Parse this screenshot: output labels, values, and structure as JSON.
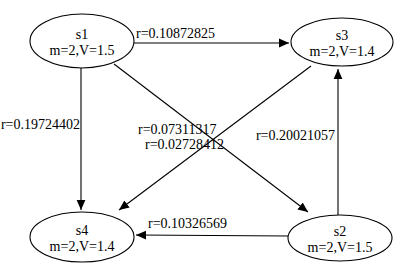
{
  "diagram": {
    "background_color": "#ffffff",
    "line_color": "#000000",
    "text_color": "#000000",
    "node_fill_color": "#ffffff",
    "nodes": [
      {
        "id": "s1",
        "label": "s1",
        "sublabel": "m=2,V=1.5",
        "cx": 82,
        "cy": 41,
        "rx": 52,
        "ry": 27
      },
      {
        "id": "s3",
        "label": "s3",
        "sublabel": "m=2,V=1.4",
        "cx": 342,
        "cy": 42,
        "rx": 51,
        "ry": 24
      },
      {
        "id": "s4",
        "label": "s4",
        "sublabel": "m=2,V=1.4",
        "cx": 82,
        "cy": 237,
        "rx": 52,
        "ry": 25
      },
      {
        "id": "s2",
        "label": "s2",
        "sublabel": "m=2,V=1.5",
        "cx": 340,
        "cy": 238,
        "rx": 52,
        "ry": 23
      }
    ],
    "edges": [
      {
        "from": "s1",
        "to": "s3",
        "label": "r=0.10872825",
        "x1": 134,
        "y1": 43,
        "x2": 289,
        "y2": 43,
        "label_x": 136,
        "label_y": 38,
        "label_anchor": "start"
      },
      {
        "from": "s1",
        "to": "s4",
        "label": "r=0.19724402",
        "x1": 81,
        "y1": 68,
        "x2": 81,
        "y2": 210,
        "label_x": 80,
        "label_y": 129,
        "label_anchor": "end"
      },
      {
        "from": "s1",
        "to": "s2",
        "label": "r=0.07311317",
        "x1": 114,
        "y1": 64,
        "x2": 308,
        "y2": 212,
        "label_x": 138,
        "label_y": 134,
        "label_anchor": "start"
      },
      {
        "from": "s3",
        "to": "s4",
        "label": "r=0.02728412",
        "x1": 311,
        "y1": 66,
        "x2": 119,
        "y2": 210,
        "label_x": 145,
        "label_y": 149,
        "label_anchor": "start"
      },
      {
        "from": "s2",
        "to": "s3",
        "label": "r=0.20021057",
        "x1": 338,
        "y1": 215,
        "x2": 338,
        "y2": 69,
        "label_x": 335,
        "label_y": 140,
        "label_anchor": "end"
      },
      {
        "from": "s2",
        "to": "s4",
        "label": "r=0.10326569",
        "x1": 288,
        "y1": 236,
        "x2": 136,
        "y2": 235,
        "label_x": 148,
        "label_y": 228,
        "label_anchor": "start"
      }
    ]
  }
}
